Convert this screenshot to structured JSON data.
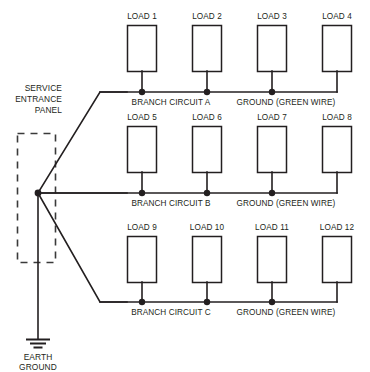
{
  "diagram": {
    "title_labels": {
      "service_panel_line1": "SERVICE",
      "service_panel_line2": "ENTRANCE",
      "service_panel_line3": "PANEL",
      "earth_ground_line1": "EARTH",
      "earth_ground_line2": "GROUND"
    },
    "colors": {
      "wire": "#231f20",
      "panel_dash": "#3a3a3a",
      "background": "#ffffff",
      "box_fill": "#ffffff"
    },
    "rows": [
      {
        "circuit_label": "BRANCH CIRCUIT A",
        "ground_label": "GROUND (GREEN WIRE)",
        "loads": [
          {
            "label": "LOAD 1"
          },
          {
            "label": "LOAD 2"
          },
          {
            "label": "LOAD 3"
          },
          {
            "label": "LOAD 4"
          }
        ]
      },
      {
        "circuit_label": "BRANCH CIRCUIT B",
        "ground_label": "GROUND (GREEN WIRE)",
        "loads": [
          {
            "label": "LOAD 5"
          },
          {
            "label": "LOAD 6"
          },
          {
            "label": "LOAD 7"
          },
          {
            "label": "LOAD 8"
          }
        ]
      },
      {
        "circuit_label": "BRANCH CIRCUIT C",
        "ground_label": "GROUND (GREEN WIRE)",
        "loads": [
          {
            "label": "LOAD 9"
          },
          {
            "label": "LOAD 10"
          },
          {
            "label": "LOAD 11"
          },
          {
            "label": "LOAD 12"
          }
        ]
      }
    ]
  }
}
